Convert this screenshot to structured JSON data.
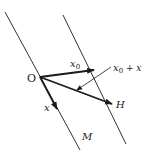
{
  "diagram": {
    "labels": {
      "origin": "O",
      "x0": "x",
      "x0_sub": "0",
      "x": "x",
      "sum_x": "x",
      "sum_sub": "0",
      "sum_rest": " + x",
      "H": "H",
      "M": "M"
    },
    "colors": {
      "stroke": "#1a1a1a",
      "background": "#ffffff"
    }
  }
}
